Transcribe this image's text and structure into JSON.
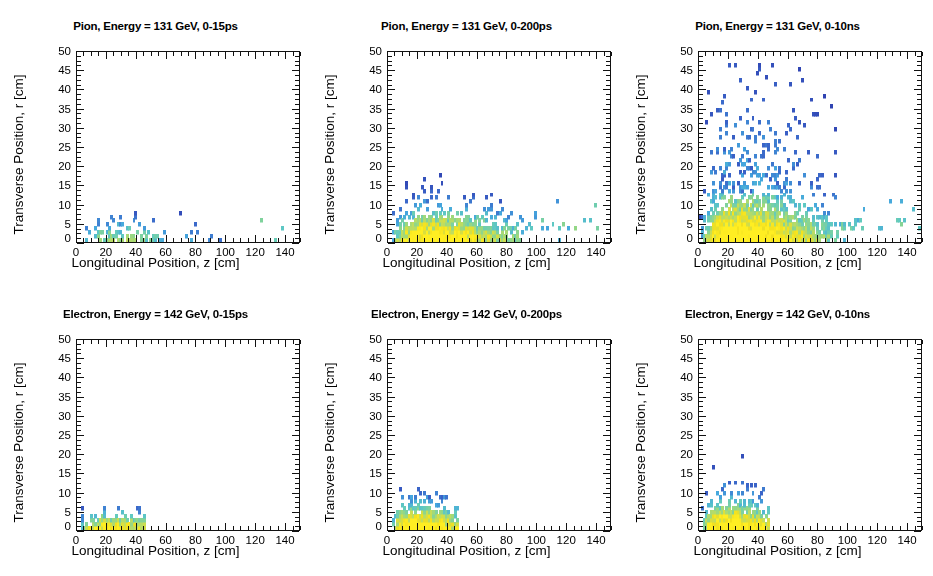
{
  "figure": {
    "width": 933,
    "height": 576,
    "rows": 2,
    "cols": 3,
    "background": "#ffffff"
  },
  "axes": {
    "xlabel": "Longitudinal Position, z [cm]",
    "ylabel": "Transverse Position, r [cm]",
    "xlim": [
      0,
      150
    ],
    "ylim": [
      0,
      50
    ],
    "xticks": [
      0,
      20,
      40,
      60,
      80,
      100,
      120,
      140
    ],
    "yticks": [
      0,
      5,
      10,
      15,
      20,
      25,
      30,
      35,
      40,
      45,
      50
    ],
    "xminor_step": 5,
    "yminor_step": 1.25,
    "grid": false
  },
  "colormap": {
    "name": "rainbow-low-blue-high-yellow",
    "stops": [
      "#2b35a8",
      "#3a63c8",
      "#45a7de",
      "#5fc9c2",
      "#8fd68a",
      "#c3dd5c",
      "#f2e01e",
      "#ffee22"
    ],
    "low_label": "low density",
    "high_label": "high density"
  },
  "chart_data": [
    {
      "type": "heatmap",
      "panel_id": "pion-0-15ps",
      "title": "Pion, Energy = 131 GeV, 0-15ps",
      "particle": "Pion",
      "energy": "131 GeV",
      "time_window": "0-15ps",
      "xlabel": "Longitudinal Position, z [cm]",
      "ylabel": "Transverse Position, r [cm]",
      "xlim": [
        0,
        150
      ],
      "ylim": [
        0,
        50
      ],
      "bin_size": [
        1.5,
        1.0
      ],
      "description": "Sparse narrow core along r < 6 cm extending from z=0 to z~118 cm with a few isolated hits out to z~148 cm.",
      "core_extent_z": [
        0,
        118
      ],
      "core_extent_r": [
        0,
        6
      ],
      "max_r_observed": 6,
      "max_z_observed": 148,
      "seed": 11,
      "density": 0.3,
      "profile": {
        "z_core_end": 118,
        "r_core": 4.0,
        "r_spread_scale": 1.0,
        "tail_z_end": 150,
        "tail_density": 0.05,
        "peak_z": 26,
        "peak_width": 16
      }
    },
    {
      "type": "heatmap",
      "panel_id": "pion-0-200ps",
      "title": "Pion, Energy = 131 GeV, 0-200ps",
      "particle": "Pion",
      "energy": "131 GeV",
      "time_window": "0-200ps",
      "xlabel": "Longitudinal Position, z [cm]",
      "ylabel": "Transverse Position, r [cm]",
      "xlim": [
        0,
        150
      ],
      "ylim": [
        0,
        50
      ],
      "bin_size": [
        1.5,
        1.0
      ],
      "description": "Dense yellow core r < 6 cm from z=5 to z~90 cm, green/cyan halo up to r~15 cm, isolated hits to r~18 cm, and a thin blue band at r~5-6 cm continuing to z=150 cm.",
      "core_extent_z": [
        3,
        92
      ],
      "core_extent_r": [
        0,
        15
      ],
      "max_r_observed": 18,
      "max_z_observed": 150,
      "seed": 27,
      "density": 0.78,
      "profile": {
        "z_core_end": 92,
        "r_core": 5.0,
        "r_spread_scale": 4.0,
        "tail_z_end": 150,
        "tail_density": 0.38,
        "peak_z": 30,
        "peak_width": 34
      }
    },
    {
      "type": "heatmap",
      "panel_id": "pion-0-10ns",
      "title": "Pion, Energy = 131 GeV, 0-10ns",
      "particle": "Pion",
      "energy": "131 GeV",
      "time_window": "0-10ns",
      "xlabel": "Longitudinal Position, z [cm]",
      "ylabel": "Transverse Position, r [cm]",
      "xlim": [
        0,
        150
      ],
      "ylim": [
        0,
        50
      ],
      "bin_size": [
        1.5,
        1.0
      ],
      "description": "Broad shower: saturated yellow core r < 7 cm from z=8 to z~92 cm, heavy blue/cyan scatter filling r up to 50 cm, thin band at r~5-6 cm out to z=150 cm.",
      "core_extent_z": [
        0,
        150
      ],
      "core_extent_r": [
        0,
        50
      ],
      "max_r_observed": 50,
      "max_z_observed": 150,
      "seed": 43,
      "density": 1.0,
      "profile": {
        "z_core_end": 95,
        "r_core": 5.5,
        "r_spread_scale": 13.0,
        "tail_z_end": 150,
        "tail_density": 0.55,
        "peak_z": 28,
        "peak_width": 40
      }
    },
    {
      "type": "heatmap",
      "panel_id": "electron-0-15ps",
      "title": "Electron, Energy = 142 GeV, 0-15ps",
      "particle": "Electron",
      "energy": "142 GeV",
      "time_window": "0-15ps",
      "xlabel": "Longitudinal Position, z [cm]",
      "ylabel": "Transverse Position, r [cm]",
      "xlim": [
        0,
        150
      ],
      "ylim": [
        0,
        50
      ],
      "bin_size": [
        1.5,
        1.0
      ],
      "description": "Very compact yellow core r < 4 cm from z=2 to z~45 cm with blue caps up to r~6 cm; nothing beyond z~49 cm.",
      "core_extent_z": [
        2,
        48
      ],
      "core_extent_r": [
        0,
        6
      ],
      "max_r_observed": 6,
      "max_z_observed": 49,
      "seed": 61,
      "density": 0.62,
      "profile": {
        "z_core_end": 46,
        "r_core": 3.0,
        "r_spread_scale": 1.4,
        "tail_z_end": 49,
        "tail_density": 0.0,
        "peak_z": 22,
        "peak_width": 16
      }
    },
    {
      "type": "heatmap",
      "panel_id": "electron-0-200ps",
      "title": "Electron, Energy = 142 GeV, 0-200ps",
      "particle": "Electron",
      "energy": "142 GeV",
      "time_window": "0-200ps",
      "xlabel": "Longitudinal Position, z [cm]",
      "ylabel": "Transverse Position, r [cm]",
      "xlim": [
        0,
        150
      ],
      "ylim": [
        0,
        50
      ],
      "bin_size": [
        1.5,
        1.0
      ],
      "description": "Compact shower: yellow core r < 4 cm z=1 to 45 cm, green/cyan shoulder to r~7 cm, blue scatter up to r~19 cm, ends abruptly near z~52 cm.",
      "core_extent_z": [
        1,
        52
      ],
      "core_extent_r": [
        0,
        19
      ],
      "max_r_observed": 19,
      "max_z_observed": 52,
      "seed": 79,
      "density": 0.85,
      "profile": {
        "z_core_end": 48,
        "r_core": 3.5,
        "r_spread_scale": 4.6,
        "tail_z_end": 52,
        "tail_density": 0.0,
        "peak_z": 20,
        "peak_width": 18
      }
    },
    {
      "type": "heatmap",
      "panel_id": "electron-0-10ns",
      "title": "Electron, Energy = 142 GeV, 0-10ns",
      "particle": "Electron",
      "energy": "142 GeV",
      "time_window": "0-10ns",
      "xlabel": "Longitudinal Position, z [cm]",
      "ylabel": "Transverse Position, r [cm]",
      "xlim": [
        0,
        150
      ],
      "ylim": [
        0,
        50
      ],
      "bin_size": [
        1.5,
        1.0
      ],
      "description": "Compact shower nearly identical to 0-200ps: yellow core r < 5 cm z=1 to 45 cm, blue scatter to r~19 cm, ends near z~52 cm.",
      "core_extent_z": [
        1,
        52
      ],
      "core_extent_r": [
        0,
        19
      ],
      "max_r_observed": 19,
      "max_z_observed": 52,
      "seed": 97,
      "density": 0.9,
      "profile": {
        "z_core_end": 48,
        "r_core": 4.0,
        "r_spread_scale": 4.8,
        "tail_z_end": 52,
        "tail_density": 0.0,
        "peak_z": 20,
        "peak_width": 19
      }
    }
  ],
  "panel_positions": [
    {
      "left": 0,
      "top": 0
    },
    {
      "left": 311,
      "top": 0
    },
    {
      "left": 622,
      "top": 0
    },
    {
      "left": 0,
      "top": 288
    },
    {
      "left": 311,
      "top": 288
    },
    {
      "left": 622,
      "top": 288
    }
  ]
}
